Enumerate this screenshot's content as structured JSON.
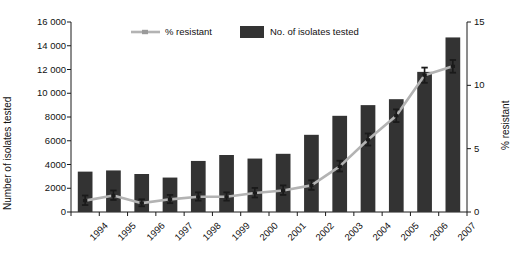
{
  "chart_data": {
    "type": "bar",
    "title": "",
    "subtitle": "",
    "categories": [
      "1994",
      "1995",
      "1996",
      "1997",
      "1998",
      "1999",
      "2000",
      "2001",
      "2002",
      "2003",
      "2004",
      "2005",
      "2006",
      "2007"
    ],
    "xlabel": "",
    "grid": false,
    "legend_position": "top",
    "axes": {
      "left": {
        "label": "Number of isolates tested",
        "min": 0,
        "max": 16000,
        "step": 2000,
        "ticks": [
          "0",
          "2000",
          "4000",
          "6000",
          "8000",
          "10 000",
          "12 000",
          "14 000",
          "16 000"
        ]
      },
      "right": {
        "label": "% resistant",
        "min": 0,
        "max": 15,
        "step": 5,
        "ticks": [
          "0",
          "5",
          "10",
          "15"
        ]
      }
    },
    "series": [
      {
        "name": "No. of isolates tested",
        "kind": "bar",
        "axis": "left",
        "color": "#333333",
        "values": [
          3400,
          3500,
          3200,
          2900,
          4300,
          4800,
          4500,
          4900,
          6500,
          8100,
          9000,
          9500,
          11800,
          14700
        ]
      },
      {
        "name": "% resistant",
        "kind": "line",
        "axis": "right",
        "color": "#b3b3b3",
        "marker_color": "#1a1a1a",
        "values": [
          0.9,
          1.3,
          0.7,
          1.0,
          1.2,
          1.2,
          1.5,
          1.7,
          2.1,
          3.6,
          5.7,
          7.6,
          10.8,
          11.5
        ],
        "error_low": [
          0.55,
          0.95,
          0.45,
          0.7,
          0.9,
          0.9,
          1.15,
          1.35,
          1.75,
          3.2,
          5.25,
          7.1,
          10.2,
          11.0
        ],
        "error_high": [
          1.3,
          1.7,
          1.0,
          1.35,
          1.55,
          1.55,
          1.9,
          2.1,
          2.5,
          4.05,
          6.2,
          8.1,
          11.4,
          12.0
        ]
      }
    ]
  },
  "legend": {
    "items": [
      {
        "label": "% resistant",
        "marker": "line-marker"
      },
      {
        "label": "No. of isolates tested",
        "marker": "filled-square"
      }
    ]
  }
}
